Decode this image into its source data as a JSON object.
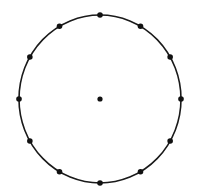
{
  "diagram": {
    "type": "circle-with-points",
    "background": "#ffffff",
    "stroke_color": "#1a1a1a",
    "point_color": "#111111",
    "circle": {
      "cx": 100,
      "cy": 99,
      "rx": 81,
      "ry": 84,
      "stroke_width": 1.6
    },
    "center_point": {
      "x": 100,
      "y": 99,
      "r": 2.6
    },
    "perimeter_point_count": 12,
    "perimeter_point_radius": 2.8
  }
}
